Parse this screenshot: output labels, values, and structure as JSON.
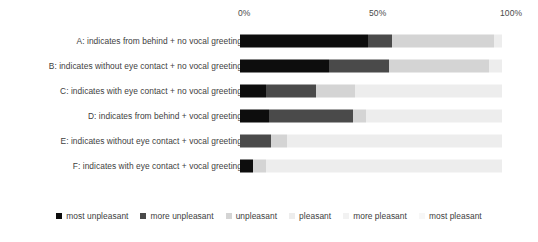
{
  "chart_data": {
    "type": "bar",
    "orientation": "horizontal",
    "stacked": true,
    "normalized": true,
    "title": "",
    "subtitle": "",
    "xlabel": "",
    "ylabel": "",
    "xlim": [
      0,
      100
    ],
    "grid": false,
    "legend_position": "bottom",
    "axis_ticks": [
      {
        "label": "0%",
        "value": 0
      },
      {
        "label": "50%",
        "value": 50
      },
      {
        "label": "100%",
        "value": 100
      }
    ],
    "categories": [
      "A: indicates from behind + no vocal greeting",
      "B: indicates without eye contact + no vocal greeting",
      "C: indicates with eye contact + no vocal greeting",
      "D: indicates from behind + vocal greeting",
      "E: indicates without eye contact + vocal greeting",
      "F: indicates with eye contact + vocal greeting"
    ],
    "series": [
      {
        "name": "most unpleasant",
        "color": "#0d0d0d",
        "values": [
          49,
          34,
          10,
          11,
          0,
          5
        ]
      },
      {
        "name": "more unpleasant",
        "color": "#4a4a4a",
        "values": [
          9,
          23,
          19,
          32,
          12,
          0
        ]
      },
      {
        "name": "unpleasant",
        "color": "#d4d4d4",
        "values": [
          39,
          38,
          15,
          5,
          6,
          5
        ]
      },
      {
        "name": "pleasant",
        "color": "#ededed",
        "values": [
          3,
          5,
          56,
          52,
          82,
          90
        ]
      },
      {
        "name": "more pleasant",
        "color": "#f5f5f5",
        "values": [
          0,
          0,
          0,
          0,
          0,
          0
        ]
      },
      {
        "name": "most pleasant",
        "color": "#fcfcfc",
        "values": [
          0,
          0,
          0,
          0,
          0,
          0
        ]
      }
    ]
  },
  "legend": {
    "entries": [
      {
        "label": "most unpleasant",
        "color": "#0d0d0d"
      },
      {
        "label": "more unpleasant",
        "color": "#4a4a4a"
      },
      {
        "label": "unpleasant",
        "color": "#d4d4d4"
      },
      {
        "label": "pleasant",
        "color": "#ededed"
      },
      {
        "label": "more pleasant",
        "color": "#f2f2f2"
      },
      {
        "label": "most pleasant",
        "color": "#f7f7f7"
      }
    ]
  }
}
